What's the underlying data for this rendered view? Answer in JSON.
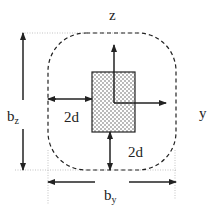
{
  "diagram": {
    "labels": {
      "z_axis": "z",
      "y_axis": "y",
      "bz_main": "b",
      "bz_sub": "z",
      "by_main": "b",
      "by_sub": "y",
      "offset_left": "2d",
      "offset_bottom": "2d"
    },
    "colors": {
      "stroke": "#222222",
      "fill_pattern": "#dddddd",
      "guide": "#999999"
    }
  }
}
